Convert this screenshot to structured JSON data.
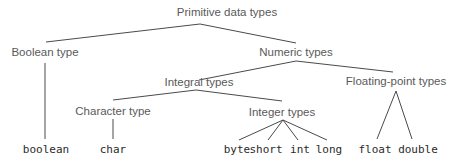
{
  "diagram": {
    "title": "Primitive data types",
    "line_color": "#4a4a4a",
    "nodes": {
      "root": {
        "label": "Primitive data types",
        "x": 227,
        "y": 13
      },
      "boolean_type": {
        "label": "Boolean type",
        "x": 45,
        "y": 53
      },
      "numeric_types": {
        "label": "Numeric types",
        "x": 296,
        "y": 53
      },
      "integral_types": {
        "label": "Integral types",
        "x": 199,
        "y": 83
      },
      "floating_point_types": {
        "label": "Floating-point types",
        "x": 396,
        "y": 82
      },
      "character_type": {
        "label": "Character type",
        "x": 113,
        "y": 112
      },
      "integer_types": {
        "label": "Integer types",
        "x": 282,
        "y": 113
      }
    },
    "leaves": [
      {
        "label": "boolean",
        "x": 46,
        "y": 149
      },
      {
        "label": "char",
        "x": 113,
        "y": 149
      },
      {
        "label": "byte",
        "x": 237,
        "y": 149
      },
      {
        "label": "short",
        "x": 266,
        "y": 149
      },
      {
        "label": "int",
        "x": 300,
        "y": 149
      },
      {
        "label": "long",
        "x": 329,
        "y": 149
      },
      {
        "label": "float",
        "x": 375,
        "y": 149
      },
      {
        "label": "double",
        "x": 418,
        "y": 149
      }
    ],
    "edges": [
      {
        "from": "Primitive data types",
        "to": "Boolean type",
        "x1": 200,
        "y1": 24,
        "x2": 46,
        "y2": 42
      },
      {
        "from": "Primitive data types",
        "to": "Numeric types",
        "x1": 200,
        "y1": 24,
        "x2": 296,
        "y2": 43
      },
      {
        "from": "Boolean type",
        "to": "boolean",
        "x1": 45,
        "y1": 63,
        "x2": 45,
        "y2": 139
      },
      {
        "from": "Numeric types",
        "to": "Integral types",
        "x1": 296,
        "y1": 61,
        "x2": 199,
        "y2": 80
      },
      {
        "from": "Numeric types",
        "to": "Floating-point types",
        "x1": 296,
        "y1": 61,
        "x2": 393,
        "y2": 72
      },
      {
        "from": "Integral types",
        "to": "Character type",
        "x1": 196,
        "y1": 90,
        "x2": 113,
        "y2": 100
      },
      {
        "from": "Integral types",
        "to": "Integer types",
        "x1": 196,
        "y1": 90,
        "x2": 282,
        "y2": 101
      },
      {
        "from": "Character type",
        "to": "char",
        "x1": 113,
        "y1": 119,
        "x2": 113,
        "y2": 139
      },
      {
        "from": "Integer types",
        "to": "byte",
        "x1": 283,
        "y1": 120,
        "x2": 239,
        "y2": 140
      },
      {
        "from": "Integer types",
        "to": "short",
        "x1": 283,
        "y1": 120,
        "x2": 268,
        "y2": 140
      },
      {
        "from": "Integer types",
        "to": "int",
        "x1": 283,
        "y1": 120,
        "x2": 298,
        "y2": 140
      },
      {
        "from": "Integer types",
        "to": "long",
        "x1": 283,
        "y1": 120,
        "x2": 327,
        "y2": 140
      },
      {
        "from": "Floating-point types",
        "to": "float",
        "x1": 396,
        "y1": 91,
        "x2": 377,
        "y2": 139
      },
      {
        "from": "Floating-point types",
        "to": "double",
        "x1": 396,
        "y1": 91,
        "x2": 412,
        "y2": 139
      }
    ]
  }
}
